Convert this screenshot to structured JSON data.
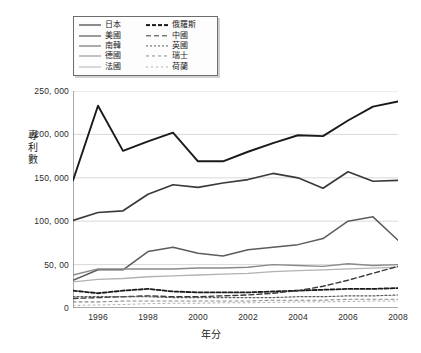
{
  "top_strip_text": "",
  "legend": {
    "rows": [
      {
        "left": {
          "label": "日本",
          "style": "solid",
          "color": "#1a1a1a",
          "width": 1.9
        },
        "right": {
          "label": "俄羅斯",
          "style": "dashed-thick",
          "color": "#1a1a1a",
          "width": 1.8
        }
      },
      {
        "left": {
          "label": "美國",
          "style": "solid",
          "color": "#3a3a3a",
          "width": 1.7
        },
        "right": {
          "label": "中國",
          "style": "dashed-long",
          "color": "#3a3a3a",
          "width": 1.4
        }
      },
      {
        "left": {
          "label": "南韓",
          "style": "solid",
          "color": "#5c5c5c",
          "width": 1.5
        },
        "right": {
          "label": "英國",
          "style": "dotted-fine",
          "color": "#5c5c5c",
          "width": 1.2
        }
      },
      {
        "left": {
          "label": "德國",
          "style": "solid",
          "color": "#8a8a8a",
          "width": 1.4
        },
        "right": {
          "label": "瑞士",
          "style": "dashed-sparse",
          "color": "#8a8a8a",
          "width": 1.1
        }
      },
      {
        "left": {
          "label": "法國",
          "style": "solid",
          "color": "#b2b2b2",
          "width": 1.3
        },
        "right": {
          "label": "荷蘭",
          "style": "dotted-faint",
          "color": "#b2b2b2",
          "width": 1.0
        }
      }
    ]
  },
  "axis": {
    "ylabel": "專利數",
    "xlabel": "年分",
    "yticks": [
      "250, 000",
      "200, 000",
      "150, 000",
      "100, 000",
      "50, 00",
      "0"
    ],
    "ytick_values": [
      250000,
      200000,
      150000,
      100000,
      50000,
      0
    ],
    "xticks": [
      "1996",
      "1998",
      "2000",
      "2002",
      "2004",
      "2006",
      "2008"
    ],
    "xtick_values": [
      1996,
      1998,
      2000,
      2002,
      2004,
      2006,
      2008
    ]
  },
  "chart_data": {
    "type": "line",
    "title": "",
    "xlabel": "年分",
    "ylabel": "專利數",
    "xlim": [
      1995,
      2008
    ],
    "ylim": [
      0,
      250000
    ],
    "grid": true,
    "legend_position": "top-left",
    "x": [
      1995,
      1996,
      1997,
      1998,
      1999,
      2000,
      2001,
      2002,
      2003,
      2004,
      2005,
      2006,
      2007,
      2008
    ],
    "series": [
      {
        "name": "日本",
        "style": "solid",
        "color": "#1a1a1a",
        "width": 1.9,
        "values": [
          147000,
          233000,
          181000,
          192000,
          202000,
          169000,
          169000,
          180000,
          190000,
          199000,
          198000,
          216000,
          232000,
          238000
        ]
      },
      {
        "name": "美國",
        "style": "solid",
        "color": "#3a3a3a",
        "width": 1.7,
        "values": [
          101000,
          110000,
          112000,
          131000,
          142000,
          139000,
          144000,
          148000,
          155000,
          150000,
          138000,
          157000,
          146000,
          147000
        ]
      },
      {
        "name": "南韓",
        "style": "solid",
        "color": "#5c5c5c",
        "width": 1.5,
        "values": [
          32000,
          44000,
          44000,
          65000,
          70000,
          63000,
          60000,
          67000,
          70000,
          73000,
          80000,
          100000,
          105000,
          78000
        ]
      },
      {
        "name": "德國",
        "style": "solid",
        "color": "#8a8a8a",
        "width": 1.4,
        "values": [
          38000,
          45000,
          45000,
          45000,
          45000,
          46000,
          46000,
          47000,
          50000,
          49000,
          48000,
          51000,
          49000,
          50000
        ]
      },
      {
        "name": "法國",
        "style": "solid",
        "color": "#b2b2b2",
        "width": 1.3,
        "values": [
          30000,
          33000,
          34000,
          36000,
          37000,
          38000,
          39000,
          40000,
          42000,
          43000,
          44000,
          45000,
          46000,
          47000
        ]
      },
      {
        "name": "俄羅斯",
        "style": "dashed-thick",
        "color": "#1a1a1a",
        "width": 1.8,
        "values": [
          20000,
          17000,
          20000,
          22000,
          19000,
          18000,
          18000,
          18000,
          19000,
          20000,
          21000,
          22000,
          22000,
          23000
        ]
      },
      {
        "name": "中國",
        "style": "dashed-long",
        "color": "#3a3a3a",
        "width": 1.4,
        "values": [
          11000,
          12000,
          13000,
          14000,
          13000,
          13000,
          14000,
          15000,
          17000,
          20000,
          25000,
          32000,
          40000,
          48000
        ]
      },
      {
        "name": "英國",
        "style": "dotted-fine",
        "color": "#5c5c5c",
        "width": 1.2,
        "values": [
          13000,
          13000,
          13000,
          13000,
          12000,
          12000,
          12000,
          12000,
          12000,
          13000,
          13000,
          14000,
          14000,
          15000
        ]
      },
      {
        "name": "瑞士",
        "style": "dashed-sparse",
        "color": "#8a8a8a",
        "width": 1.1,
        "values": [
          7000,
          7000,
          8000,
          8000,
          8000,
          8000,
          8000,
          8000,
          9000,
          9000,
          9000,
          10000,
          10000,
          10000
        ]
      },
      {
        "name": "荷蘭",
        "style": "dotted-faint",
        "color": "#b2b2b2",
        "width": 1.0,
        "values": [
          3000,
          3500,
          4000,
          5000,
          5500,
          5500,
          6000,
          6000,
          6500,
          7000,
          7000,
          7500,
          8000,
          8000
        ]
      }
    ]
  }
}
